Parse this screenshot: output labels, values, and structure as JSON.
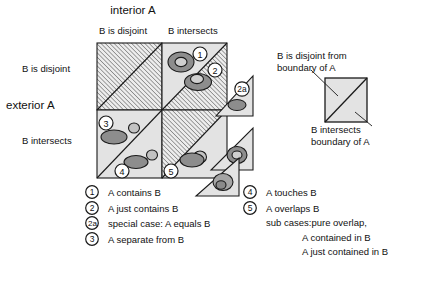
{
  "title": "interior A",
  "axes": {
    "top_axis_label": "interior A",
    "left_axis_label": "exterior A",
    "column_headers": [
      "B is disjoint",
      "B intersects"
    ],
    "row_headers": [
      "B is disjoint",
      "B intersects"
    ]
  },
  "boundary_legend": {
    "top_note_line1": "B is disjoint from",
    "top_note_line2": "boundary of A",
    "bottom_note_line1": "B intersects",
    "bottom_note_line2": "boundary of A"
  },
  "key_left": [
    {
      "num": "1",
      "text": "A contains B"
    },
    {
      "num": "2",
      "text": "A just contains B"
    },
    {
      "num": "2a",
      "text": "special case: A equals B"
    },
    {
      "num": "3",
      "text": "A separate from B"
    }
  ],
  "key_right": [
    {
      "num": "4",
      "text": "A touches B"
    },
    {
      "num": "5",
      "text": "A overlaps B"
    }
  ],
  "sub_cases": [
    "sub cases:pure overlap,",
    "A contained in B",
    "A just contained in B"
  ],
  "cell_markers": {
    "marker_1": "1",
    "marker_2": "2",
    "marker_2a": "2a",
    "marker_3": "3",
    "marker_4": "4",
    "marker_5": "5"
  },
  "colors": {
    "cell_fill": "#e3e3e3",
    "hatch_line": "#6d6d6d",
    "outline": "#1a1a1a",
    "shape_dark": "#8a8a8a",
    "shape_light": "#c9c9c9",
    "background": "#ffffff"
  }
}
